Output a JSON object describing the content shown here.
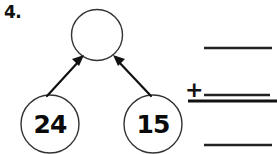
{
  "worksheet": {
    "problem_number": "4.",
    "sum_bubble": {
      "value": "",
      "label": "empty-sum-circle"
    },
    "addends": [
      {
        "value": "24",
        "label": "addend-left"
      },
      {
        "value": "15",
        "label": "addend-right"
      }
    ],
    "arrows": [
      {
        "from": "addend-left",
        "to": "sum-bubble"
      },
      {
        "from": "addend-right",
        "to": "sum-bubble"
      }
    ],
    "vertical_problem": {
      "top_blank": "",
      "operator": "+",
      "bottom_blank": "",
      "answer_blank": ""
    },
    "colors": {
      "ink": "#111111",
      "outline": "#333333",
      "paper": "#ffffff"
    }
  }
}
